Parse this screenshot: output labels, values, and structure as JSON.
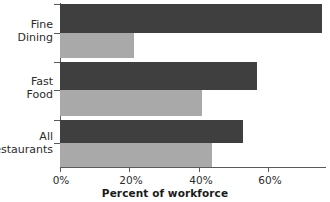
{
  "chart_data": {
    "type": "bar",
    "orientation": "horizontal",
    "title": "",
    "xlabel": "Percent of workforce",
    "ylabel": "",
    "xlim": [
      0,
      78
    ],
    "xticks": [
      0,
      20,
      40,
      60
    ],
    "xtick_labels": [
      "0%",
      "20%",
      "40%",
      "60%"
    ],
    "categories": [
      "Fine Dining",
      "Fast Food",
      "All Restaurants"
    ],
    "category_lines": [
      [
        "Fine",
        "Dining"
      ],
      [
        "Fast",
        "Food"
      ],
      [
        "All",
        "Restaurants"
      ]
    ],
    "series": [
      {
        "name": "dark",
        "color": "#3f3f3f",
        "values": [
          76,
          57,
          53
        ]
      },
      {
        "name": "light",
        "color": "#a9a9a9",
        "values": [
          21.5,
          41,
          44
        ]
      }
    ],
    "grid": false,
    "legend": "none"
  },
  "axis": {
    "x_title": "Percent of workforce",
    "ticks": [
      {
        "label": "0%",
        "value": 0
      },
      {
        "label": "20%",
        "value": 20
      },
      {
        "label": "40%",
        "value": 40
      },
      {
        "label": "60%",
        "value": 60
      }
    ]
  },
  "groups": [
    {
      "line1": "Fine",
      "line2": "Dining",
      "dark": 76,
      "light": 21.5
    },
    {
      "line1": "Fast",
      "line2": "Food",
      "dark": 57,
      "light": 41
    },
    {
      "line1": "All",
      "line2": "Restaurants",
      "dark": 53,
      "light": 44
    }
  ],
  "colors": {
    "dark_bar": "#3f3f3f",
    "light_bar": "#a9a9a9",
    "axis": "#5a5a5a",
    "text": "#2b2b2b",
    "background": "#ffffff"
  }
}
